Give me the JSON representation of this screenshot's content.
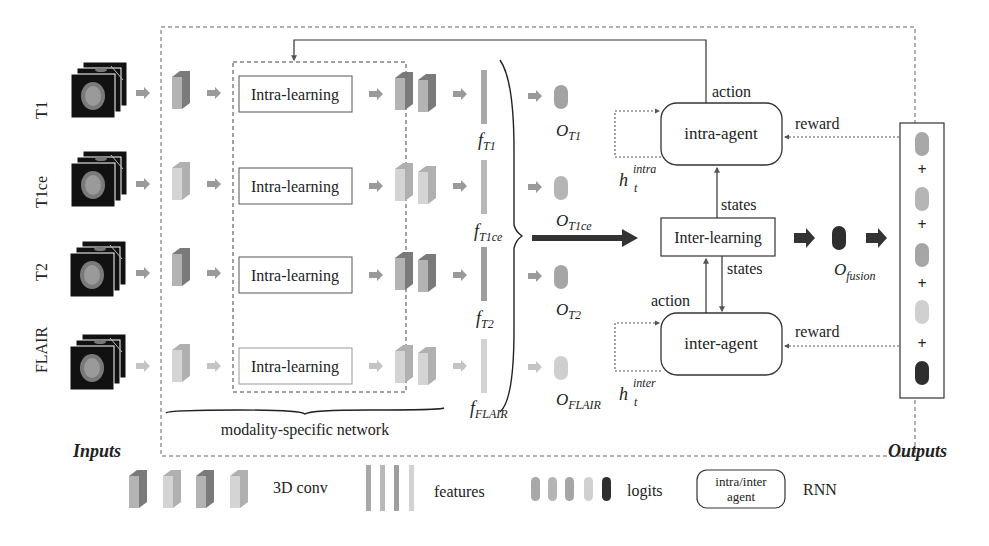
{
  "inputs": {
    "title": "Inputs",
    "modalities": [
      {
        "name": "T1",
        "feature": "f",
        "feature_sub": "T1",
        "logit": "O",
        "logit_sub": "T1"
      },
      {
        "name": "T1ce",
        "feature": "f",
        "feature_sub": "T1ce",
        "logit": "O",
        "logit_sub": "T1ce"
      },
      {
        "name": "T2",
        "feature": "f",
        "feature_sub": "T2",
        "logit": "O",
        "logit_sub": "T2"
      },
      {
        "name": "FLAIR",
        "feature": "f",
        "feature_sub": "FLAIR",
        "logit": "O",
        "logit_sub": "FLAIR"
      }
    ]
  },
  "network": {
    "intra_learning_label": "Intra-learning",
    "modality_specific_label": "modality-specific network",
    "inter_learning_label": "Inter-learning"
  },
  "agents": {
    "intra_agent_label": "intra-agent",
    "inter_agent_label": "inter-agent",
    "action_label": "action",
    "reward_label": "reward",
    "states_label": "states",
    "h_intra": {
      "base": "h",
      "sub": "t",
      "sup": "intra"
    },
    "h_inter": {
      "base": "h",
      "sub": "t",
      "sup": "inter"
    }
  },
  "fusion": {
    "base": "O",
    "sub": "fusion"
  },
  "outputs": {
    "title": "Outputs",
    "plus": "+"
  },
  "legend": {
    "conv_label": "3D conv",
    "features_label": "features",
    "logits_label": "logits",
    "agent_line1": "intra/inter",
    "agent_line2": "agent",
    "rnn_label": "RNN"
  },
  "colors": {
    "t1": "#8f8f8f",
    "t1ce": "#a9a9a9",
    "t2": "#8a8a8a",
    "flair": "#c8c8c8",
    "fusion": "#333333",
    "arrow_gray": "#999999",
    "arrow_dark": "#333333"
  }
}
